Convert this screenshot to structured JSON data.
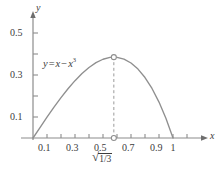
{
  "figure": {
    "name": "graph-of-y-equals-x-minus-x-cubed",
    "background_color": "#ffffff",
    "width": 223,
    "height": 177
  },
  "axes": {
    "x_axis_name": "x",
    "y_axis_name": "y",
    "axis_color": "#8c8c8c",
    "label_color": "#3c3c3c"
  },
  "labels": {
    "equation_y": "y",
    "equation_eq": "=",
    "equation_x": "x",
    "equation_minus": "−",
    "equation_x2": "x",
    "equation_exponent": "3",
    "equation_full": "y = x − x³",
    "critical_point_radical_sign": "√",
    "critical_point_radicand": "1/3",
    "critical_point_full": "√(1/3)"
  },
  "chart_data": {
    "type": "line",
    "title": "",
    "subtitle": "",
    "xlabel": "x",
    "ylabel": "y",
    "function_expression": "y = x - x^3",
    "curve_color": "#8f8f8f",
    "grid": false,
    "legend_position": "inline-annotation",
    "annotations": [
      {
        "text": "y = x − x³",
        "x": 0.22,
        "y": 0.45,
        "style": "italic"
      },
      {
        "text": "√(1/3)",
        "x": 0.5774,
        "y": -0.075,
        "style": "italic"
      }
    ],
    "xlim": [
      -0.05,
      1.18
    ],
    "ylim": [
      -0.06,
      0.56
    ],
    "x_ticks": [
      0.1,
      0.2,
      0.3,
      0.4,
      0.5,
      0.6,
      0.7,
      0.8,
      0.9,
      1.0,
      1.1
    ],
    "x_tick_labels": [
      "0.1",
      "",
      "0.3",
      "",
      "0.5",
      "",
      "0.7",
      "",
      "0.9",
      "1",
      ""
    ],
    "y_ticks": [
      0.1,
      0.2,
      0.3,
      0.4,
      0.5
    ],
    "y_tick_labels": [
      "0.1",
      "",
      "0.3",
      "",
      "0.5"
    ],
    "markers": [
      {
        "name": "maximum-point",
        "x": 0.5774,
        "y": 0.3849,
        "style": "open-circle"
      },
      {
        "name": "critical-x-point",
        "x": 0.5774,
        "y": 0.0,
        "style": "open-circle"
      }
    ],
    "dashed_guides": [
      {
        "from_x": 0.5774,
        "from_y": 0.0,
        "to_x": 0.5774,
        "to_y": 0.3849
      }
    ],
    "x": [
      0.0,
      0.05,
      0.1,
      0.15,
      0.2,
      0.25,
      0.3,
      0.35,
      0.4,
      0.45,
      0.5,
      0.55,
      0.5774,
      0.6,
      0.65,
      0.7,
      0.75,
      0.8,
      0.85,
      0.9,
      0.95,
      1.0
    ],
    "y": [
      0.0,
      0.04988,
      0.099,
      0.14663,
      0.192,
      0.23438,
      0.273,
      0.30713,
      0.336,
      0.35888,
      0.375,
      0.38363,
      0.3849,
      0.384,
      0.37538,
      0.357,
      0.32813,
      0.288,
      0.23588,
      0.171,
      0.09263,
      0.0
    ]
  },
  "x_tick_labels_display": [
    {
      "value": "0.1",
      "x": 0.1
    },
    {
      "value": "0.3",
      "x": 0.3
    },
    {
      "value": "0.5",
      "x": 0.5
    },
    {
      "value": "0.7",
      "x": 0.7
    },
    {
      "value": "0.9",
      "x": 0.9
    },
    {
      "value": "1",
      "x": 1.0
    }
  ],
  "y_tick_labels_display": [
    {
      "value": "0.1",
      "y": 0.1
    },
    {
      "value": "0.3",
      "y": 0.3
    },
    {
      "value": "0.5",
      "y": 0.5
    }
  ]
}
